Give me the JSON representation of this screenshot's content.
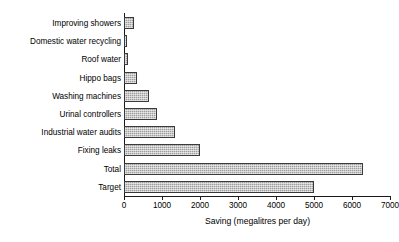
{
  "chart_data": {
    "type": "bar",
    "orientation": "horizontal",
    "title": "",
    "xlabel": "Saving (megalitres per day)",
    "ylabel": "",
    "xlim": [
      0,
      7000
    ],
    "xticks": [
      0,
      1000,
      2000,
      3000,
      4000,
      5000,
      6000,
      7000
    ],
    "xtick_labels": [
      "0",
      "1000",
      "2000",
      "3000",
      "4000",
      "5000",
      "6000",
      "7000"
    ],
    "grid": false,
    "legend": null,
    "categories": [
      "Improving showers",
      "Domestic water recycling",
      "Roof water",
      "Hippo bags",
      "Washing machines",
      "Urinal controllers",
      "Industrial water audits",
      "Fixing leaks",
      "Total",
      "Target"
    ],
    "values": [
      260,
      90,
      110,
      340,
      650,
      870,
      1350,
      2000,
      6300,
      5000
    ],
    "bar_face_color": "#9d9d9d",
    "bar_edge_color": "#3a3a3a"
  }
}
